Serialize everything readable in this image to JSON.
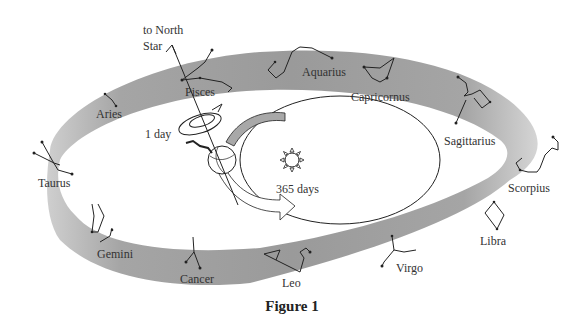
{
  "figure": {
    "caption": "Figure 1",
    "north_star_label_line1": "to North",
    "north_star_label_line2": "Star",
    "rotation_label": "1 day",
    "orbit_label": "365 days",
    "colors": {
      "band": "#9a9a9a",
      "band_light": "#cfcfcf",
      "stroke": "#222222",
      "text": "#333333"
    }
  },
  "constellations": [
    {
      "name": "Pisces"
    },
    {
      "name": "Aquarius"
    },
    {
      "name": "Capricornus"
    },
    {
      "name": "Sagittarius"
    },
    {
      "name": "Scorpius"
    },
    {
      "name": "Libra"
    },
    {
      "name": "Virgo"
    },
    {
      "name": "Leo"
    },
    {
      "name": "Cancer"
    },
    {
      "name": "Gemini"
    },
    {
      "name": "Taurus"
    },
    {
      "name": "Aries"
    }
  ]
}
